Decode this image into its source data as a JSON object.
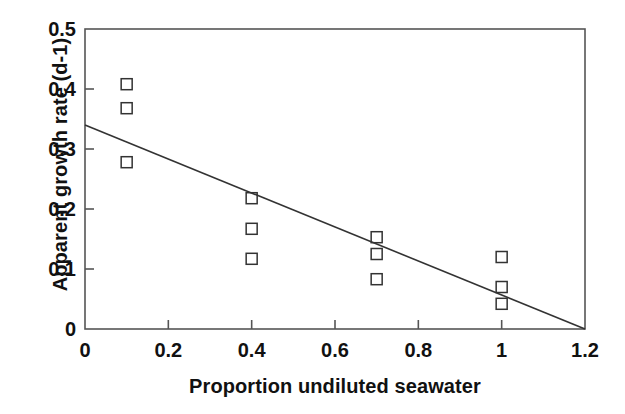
{
  "chart_data": {
    "type": "scatter",
    "title": "",
    "xlabel": "Proportion undiluted seawater",
    "ylabel": "Apparent growth rate (d-1)",
    "xlim": [
      0,
      1.2
    ],
    "ylim": [
      0,
      0.5
    ],
    "xticks": [
      0,
      0.2,
      0.4,
      0.6,
      0.8,
      1,
      1.2
    ],
    "xtick_labels": [
      "0",
      "0.2",
      "0.4",
      "0.6",
      "0.8",
      "1",
      "1.2"
    ],
    "yticks": [
      0,
      0.1,
      0.2,
      0.3,
      0.4,
      0.5
    ],
    "ytick_labels": [
      "0",
      "0.1",
      "0.2",
      "0.3",
      "0.4",
      "0.5"
    ],
    "grid": false,
    "legend": null,
    "marker": "open-square",
    "marker_color": "#333333",
    "line_color": "#333333",
    "points": [
      {
        "x": 0.1,
        "y": 0.408
      },
      {
        "x": 0.1,
        "y": 0.368
      },
      {
        "x": 0.1,
        "y": 0.278
      },
      {
        "x": 0.4,
        "y": 0.218
      },
      {
        "x": 0.4,
        "y": 0.167
      },
      {
        "x": 0.4,
        "y": 0.117
      },
      {
        "x": 0.7,
        "y": 0.153
      },
      {
        "x": 0.7,
        "y": 0.125
      },
      {
        "x": 0.7,
        "y": 0.083
      },
      {
        "x": 1.0,
        "y": 0.12
      },
      {
        "x": 1.0,
        "y": 0.07
      },
      {
        "x": 1.0,
        "y": 0.042
      }
    ],
    "fit_line": {
      "type": "linear-regression",
      "x_start": 0.0,
      "y_start": 0.34,
      "x_end": 1.2,
      "y_end": 0.0,
      "intercept": 0.34,
      "slope": -0.2833
    }
  },
  "axes": {
    "spine_color": "#555555",
    "frame": "full-box"
  }
}
